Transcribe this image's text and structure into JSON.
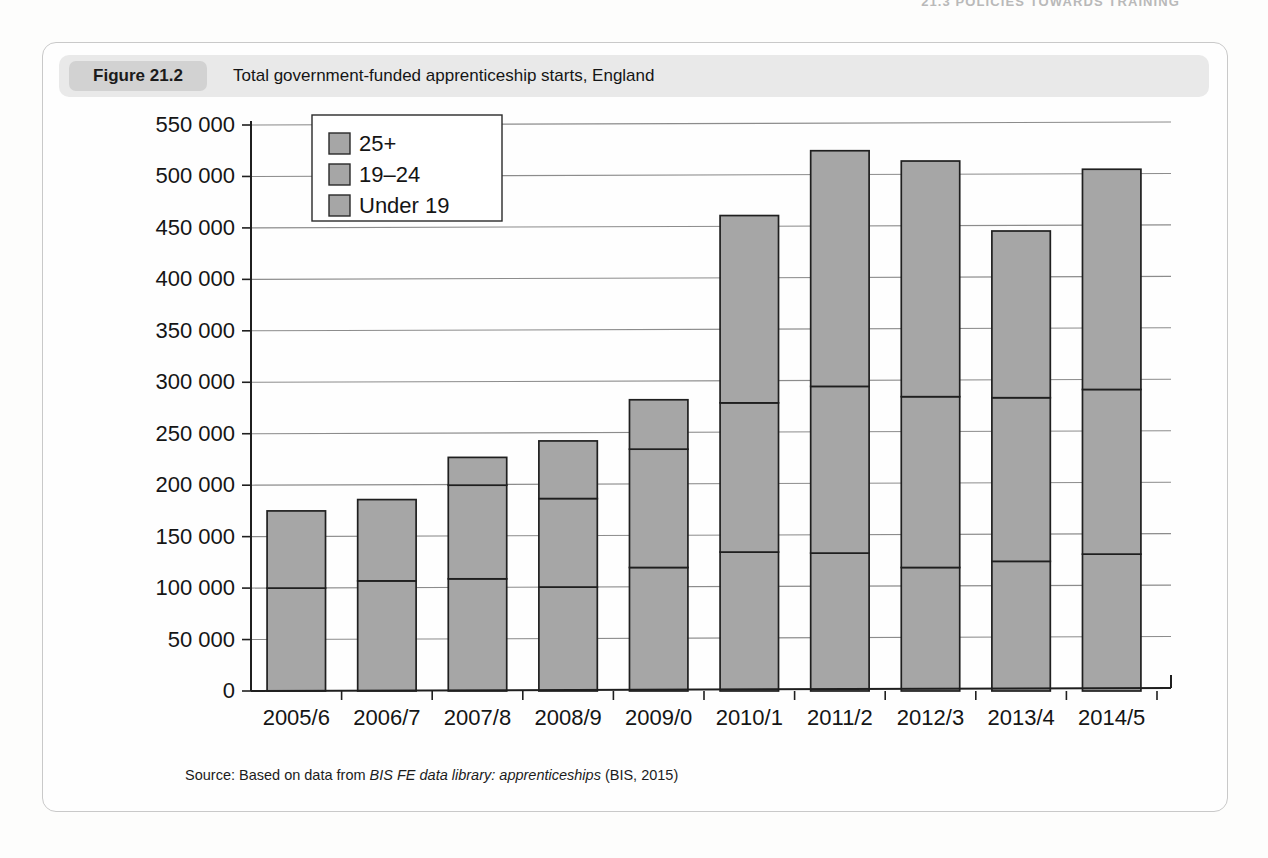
{
  "running_head": "21.3  POLICIES TOWARDS TRAINING",
  "figure": {
    "number_label": "Figure 21.2",
    "title": "Total government-funded apprenticeship starts, England",
    "source_prefix": "Source: Based on data from ",
    "source_italic": "BIS FE data library: apprenticeships",
    "source_suffix": " (BIS, 2015)"
  },
  "colors": {
    "bar_fill": "#a6a6a6",
    "bar_stroke": "#1f1f1f",
    "gridline": "#8c8c8c",
    "axis": "#1f1f1f",
    "header_band": "#e9e9e9",
    "number_pill": "#d2d2d2",
    "card_border": "#c9c9c9",
    "text": "#151515"
  },
  "chart_data": {
    "type": "bar",
    "subtype": "stacked-vertical",
    "title": "Total government-funded apprenticeship starts, England",
    "xlabel": "",
    "ylabel": "",
    "ylim": [
      0,
      550000
    ],
    "ytick_step": 50000,
    "grid": true,
    "legend_position": "top-left-inside",
    "categories": [
      "2005/6",
      "2006/7",
      "2007/8",
      "2008/9",
      "2009/0",
      "2010/1",
      "2011/2",
      "2012/3",
      "2013/4",
      "2014/5"
    ],
    "ytick_labels": [
      "0",
      "50 000",
      "100 000",
      "150 000",
      "200 000",
      "250 000",
      "300 000",
      "350 000",
      "400 000",
      "450 000",
      "500 000",
      "550 000"
    ],
    "ytick_values": [
      0,
      50000,
      100000,
      150000,
      200000,
      250000,
      300000,
      350000,
      400000,
      450000,
      500000,
      550000
    ],
    "series": [
      {
        "name": "Under 19",
        "values": [
          100000,
          107000,
          109000,
          101000,
          120000,
          135000,
          134000,
          120000,
          126000,
          133000
        ]
      },
      {
        "name": "19–24",
        "values": [
          75000,
          79000,
          91000,
          86000,
          115000,
          145000,
          162000,
          166000,
          159000,
          160000
        ]
      },
      {
        "name": "25+",
        "values": [
          0,
          0,
          27000,
          56000,
          48000,
          182000,
          229000,
          229000,
          162000,
          214000
        ]
      }
    ],
    "totals": [
      175000,
      186000,
      227000,
      243000,
      283000,
      462000,
      525000,
      515000,
      447000,
      507000
    ],
    "legend_entries": [
      "25+",
      "19–24",
      "Under 19"
    ]
  }
}
